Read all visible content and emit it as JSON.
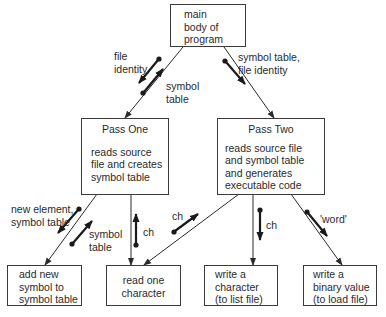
{
  "nodes": {
    "main": {
      "lines": [
        "main",
        "body of",
        "program"
      ]
    },
    "pass_one": {
      "title": "Pass One",
      "lines": [
        "reads source",
        "file and creates",
        "symbol table"
      ]
    },
    "pass_two": {
      "title": "Pass Two",
      "lines": [
        "reads source file",
        "and symbol table",
        "and generates",
        "executable code"
      ]
    },
    "add_symbol": {
      "lines": [
        "add new",
        "symbol to",
        "symbol table"
      ]
    },
    "read_char": {
      "lines": [
        "read one",
        "character"
      ]
    },
    "write_char": {
      "lines": [
        "write a",
        "character",
        "(to list file)"
      ]
    },
    "write_binary": {
      "lines": [
        "write a",
        "binary value",
        "(to load file)"
      ]
    }
  },
  "flows": {
    "main_to_pass_one_down": {
      "lines": [
        "file",
        "identity"
      ]
    },
    "main_to_pass_one_up": {
      "lines": [
        "symbol",
        "table"
      ]
    },
    "main_to_pass_two_down": {
      "lines": [
        "symbol table,",
        "file identity"
      ]
    },
    "pass_one_to_add_down": {
      "lines": [
        "new element,",
        "symbol table"
      ]
    },
    "pass_one_to_add_up": {
      "lines": [
        "symbol",
        "table"
      ]
    },
    "pass_one_to_read_up": {
      "lines": [
        "ch"
      ]
    },
    "pass_two_to_read_up": {
      "lines": [
        "ch"
      ]
    },
    "pass_two_to_write_char_down": {
      "lines": [
        "ch"
      ]
    },
    "pass_two_to_write_binary_down": {
      "lines": [
        "'word'"
      ]
    }
  }
}
